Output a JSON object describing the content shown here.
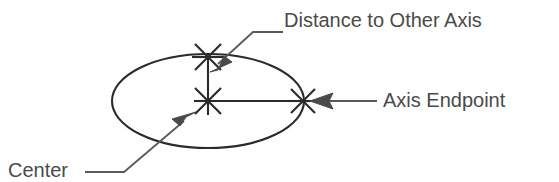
{
  "figure": {
    "type": "technical-line-drawing",
    "background_color": "#ffffff",
    "stroke_color": "#2b2b2b",
    "leader_color": "#4a4a4a",
    "text_color": "#4a4a4a"
  },
  "labels": {
    "distance": "Distance to Other Axis",
    "endpoint": "Axis Endpoint",
    "center": "Center"
  },
  "geometry": {
    "ellipse": {
      "cx": 208,
      "cy": 101,
      "rx": 96,
      "ry": 47
    },
    "markers": [
      {
        "name": "center-marker",
        "x": 208,
        "y": 101
      },
      {
        "name": "minor-axis-marker",
        "x": 208,
        "y": 57
      },
      {
        "name": "axis-endpoint-marker",
        "x": 303,
        "y": 101
      }
    ],
    "axis_lines": [
      {
        "name": "horizontal-axis",
        "x1": 208,
        "y1": 101,
        "x2": 303,
        "y2": 101
      },
      {
        "name": "vertical-axis",
        "x1": 208,
        "y1": 101,
        "x2": 208,
        "y2": 57
      }
    ],
    "leaders": [
      {
        "name": "distance-leader",
        "path": "M 283 32 L 253 32 L 214 68",
        "arrow_at": [
          214,
          68
        ],
        "arrow_angle": 137
      },
      {
        "name": "endpoint-leader",
        "path": "M 376 101 L 315 101",
        "arrow_at": [
          311,
          101
        ],
        "arrow_angle": 180
      },
      {
        "name": "center-leader",
        "path": "M 85 172 L 124 172 L 190 117",
        "arrow_at": [
          193,
          114
        ],
        "arrow_angle": -40
      }
    ]
  }
}
